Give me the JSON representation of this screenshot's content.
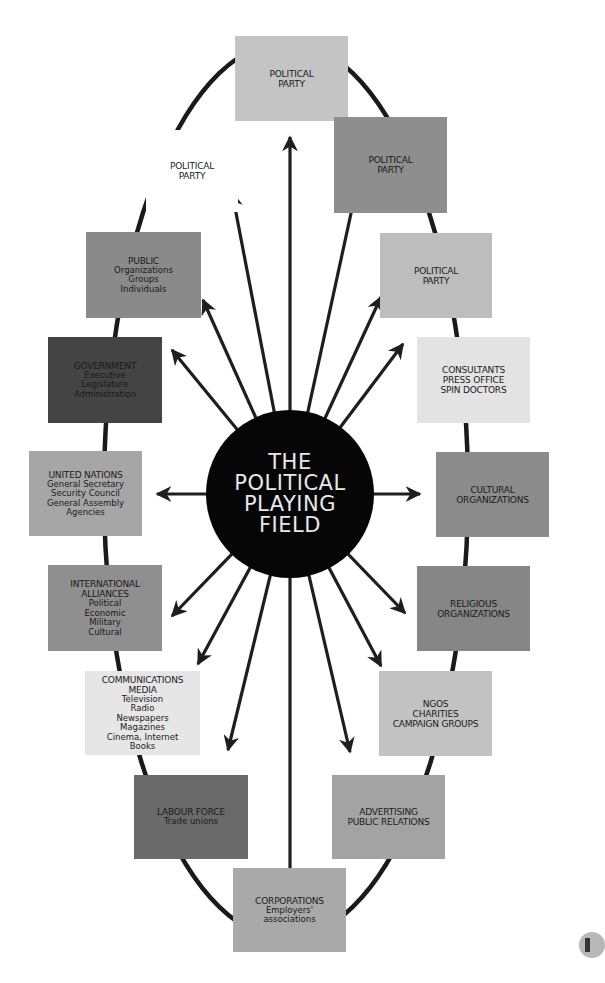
{
  "hub": {
    "lines": [
      "THE",
      "POLITICAL",
      "PLAYING",
      "FIELD"
    ],
    "color": "#060606",
    "text_color": "#e8e8e8"
  },
  "nodes": [
    {
      "id": "political-party-top",
      "title": [
        "POLITICAL",
        "PARTY"
      ],
      "sub": [],
      "color": "#c4c4c4",
      "x": 235,
      "y": 36,
      "w": 113,
      "h": 85
    },
    {
      "id": "political-party-left",
      "title": [
        "POLITICAL",
        "PARTY"
      ],
      "sub": [],
      "color": "#ffffff",
      "x": 146,
      "y": 130,
      "w": 92,
      "h": 82
    },
    {
      "id": "political-party-right-1",
      "title": [
        "POLITICAL",
        "PARTY"
      ],
      "sub": [],
      "color": "#8e8e8e",
      "x": 334,
      "y": 117,
      "w": 113,
      "h": 96
    },
    {
      "id": "public",
      "title": [
        "PUBLIC"
      ],
      "sub": [
        "Organizations",
        "Groups",
        "Individuals"
      ],
      "color": "#8a8a8a",
      "x": 86,
      "y": 232,
      "w": 115,
      "h": 86
    },
    {
      "id": "political-party-right-2",
      "title": [
        "POLITICAL",
        "PARTY"
      ],
      "sub": [],
      "color": "#bdbdbd",
      "x": 380,
      "y": 233,
      "w": 112,
      "h": 85
    },
    {
      "id": "government",
      "title": [
        "GOVERNMENT"
      ],
      "sub": [
        "Executive",
        "Legislature",
        "Administration"
      ],
      "color": "#444444",
      "x": 48,
      "y": 337,
      "w": 114,
      "h": 86
    },
    {
      "id": "consultants",
      "title": [
        "CONSULTANTS",
        "PRESS OFFICE",
        "SPIN DOCTORS"
      ],
      "sub": [],
      "color": "#e3e3e3",
      "x": 417,
      "y": 337,
      "w": 113,
      "h": 86
    },
    {
      "id": "united-nations",
      "title": [
        "UNITED NATIONS"
      ],
      "sub": [
        "General Secretary",
        "Security Council",
        "General Assembly",
        "Agencies"
      ],
      "color": "#a6a6a6",
      "x": 29,
      "y": 451,
      "w": 113,
      "h": 85
    },
    {
      "id": "cultural-organizations",
      "title": [
        "CULTURAL",
        "ORGANIZATIONS"
      ],
      "sub": [],
      "color": "#8c8c8c",
      "x": 436,
      "y": 452,
      "w": 113,
      "h": 85
    },
    {
      "id": "international-alliances",
      "title": [
        "INTERNATIONAL",
        "ALLIANCES"
      ],
      "sub": [
        "Political",
        "Economic",
        "Military",
        "Cultural"
      ],
      "color": "#8f8f8f",
      "x": 48,
      "y": 565,
      "w": 114,
      "h": 86
    },
    {
      "id": "religious-organizations",
      "title": [
        "RELIGIOUS",
        "ORGANIZATIONS"
      ],
      "sub": [],
      "color": "#868686",
      "x": 417,
      "y": 566,
      "w": 113,
      "h": 85
    },
    {
      "id": "communications-media",
      "title": [
        "COMMUNICATIONS",
        "MEDIA"
      ],
      "sub": [
        "Television",
        "Radio",
        "Newspapers",
        "Magazines",
        "Cinema, Internet",
        "Books"
      ],
      "color": "#e6e6e6",
      "x": 85,
      "y": 671,
      "w": 115,
      "h": 84
    },
    {
      "id": "ngos",
      "title": [
        "NGOs",
        "CHARITIES",
        "CAMPAIGN GROUPS"
      ],
      "sub": [],
      "color": "#c2c2c2",
      "x": 379,
      "y": 671,
      "w": 113,
      "h": 85
    },
    {
      "id": "labour-force",
      "title": [
        "LABOUR FORCE"
      ],
      "sub": [
        "Trade unions"
      ],
      "color": "#6a6a6a",
      "x": 134,
      "y": 775,
      "w": 114,
      "h": 84
    },
    {
      "id": "advertising",
      "title": [
        "ADVERTISING",
        "PUBLIC RELATIONS"
      ],
      "sub": [],
      "color": "#a3a3a3",
      "x": 332,
      "y": 775,
      "w": 113,
      "h": 84
    },
    {
      "id": "corporations",
      "title": [
        "CORPORATIONS"
      ],
      "sub": [
        "Employers'",
        "associations"
      ],
      "color": "#a9a9a9",
      "x": 233,
      "y": 868,
      "w": 113,
      "h": 84
    }
  ],
  "ring": {
    "cx": 286,
    "cy": 490,
    "rx": 182,
    "ry": 448,
    "stroke": "#1a1a1a"
  },
  "arrows": {
    "origin": [
      290,
      494
    ],
    "color": "#1e1e1e",
    "tips": [
      [
        290,
        137
      ],
      [
        232,
        192
      ],
      [
        355,
        195
      ],
      [
        203,
        300
      ],
      [
        381,
        297
      ],
      [
        172,
        350
      ],
      [
        403,
        344
      ],
      [
        157,
        494
      ],
      [
        420,
        494
      ],
      [
        172,
        616
      ],
      [
        405,
        613
      ],
      [
        198,
        664
      ],
      [
        381,
        666
      ],
      [
        228,
        750
      ],
      [
        350,
        752
      ],
      [
        290,
        893
      ]
    ]
  }
}
